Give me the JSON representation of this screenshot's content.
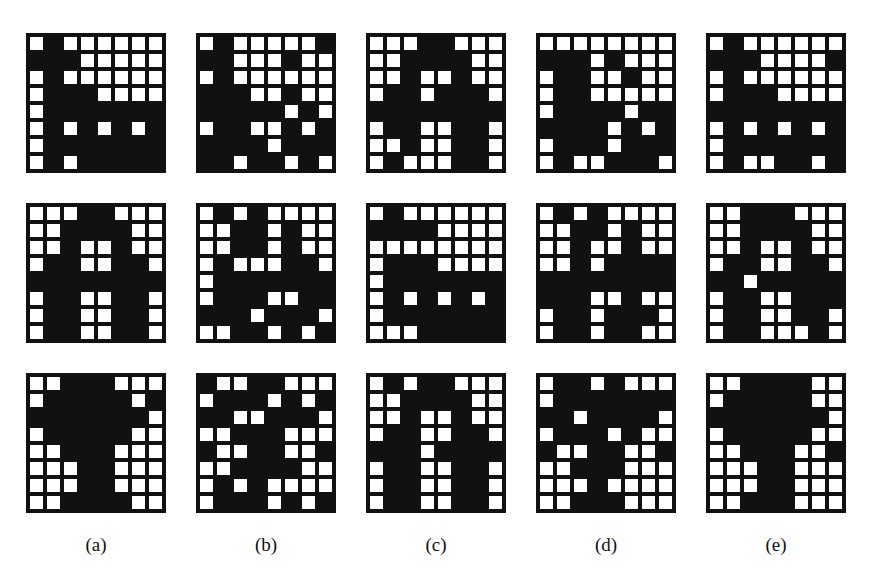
{
  "figure": {
    "columns": [
      {
        "label": "(a)",
        "x": 26
      },
      {
        "label": "(b)",
        "x": 196
      },
      {
        "label": "(c)",
        "x": 366
      },
      {
        "label": "(d)",
        "x": 536
      },
      {
        "label": "(e)",
        "x": 706
      }
    ],
    "rows_y": [
      33,
      203,
      373
    ],
    "grid_size": 8,
    "legend": {
      "white": "1 (white cell)",
      "black": "0 (black cell)"
    },
    "grids": [
      [
        [
          "WBWWWWWW",
          "BBBWWWWW",
          "WBWWWWWW",
          "WBBBWWWW",
          "WBBBBBBB",
          "WBWBWBWB",
          "WBBBBBBB",
          "WBWBBBBB"
        ],
        [
          "WBWWWWWB",
          "BBWWWBWW",
          "WBWWWWWW",
          "BBBWWBWW",
          "BBBBBWBW",
          "WBBWWBWB",
          "BBBBWBBB",
          "BBWBBWBW"
        ],
        [
          "WWWBBWWW",
          "WWBBBBWW",
          "WWBWWBWW",
          "WBBWBBBW",
          "BBBBBBBB",
          "WBBWWBBW",
          "WWBWWBBW",
          "WBWWWBBW"
        ],
        [
          "WWWWWWWW",
          "BBBWBWWW",
          "WBBWWBWW",
          "WBBWWWWW",
          "WBBBBWBB",
          "BBBBWBWB",
          "WBBBWBBB",
          "WBWWBBBW"
        ],
        [
          "WBWWWWWW",
          "BBBWWWWB",
          "WBWWWWWW",
          "WBBBWWWW",
          "BBBBBBBB",
          "WBWBWBWB",
          "WBBBBBBB",
          "WBWWBBWB"
        ]
      ],
      [
        [
          "WWWBBWWW",
          "WWBBBBWW",
          "WWBWWBWW",
          "WBBWWBBW",
          "BBBBBBBB",
          "WBBWWBBW",
          "WBBWWBBW",
          "WBBWWBBW"
        ],
        [
          "WBWBWWWW",
          "WWBBWBWW",
          "WWBBWBWW",
          "WBWWWBBW",
          "WBBBBBBB",
          "WBBBWWBB",
          "BBBWBBBW",
          "WWBBWBWB"
        ],
        [
          "WBWWWWWW",
          "BBBBWWWW",
          "WWWWWWWW",
          "WBBBWWWW",
          "WBBBBBBB",
          "WBWBWBWB",
          "WBBBBBBB",
          "WWWBBBBB"
        ],
        [
          "WBWBWWWW",
          "WWBBWBWW",
          "WWBWWBWW",
          "WWBWBBBB",
          "BBBBBBBB",
          "BBBWWBWW",
          "WBBWBBBW",
          "WBBWBBWW"
        ],
        [
          "WWBBBWWW",
          "WWBBBBWW",
          "WWBWWBWW",
          "WBBWWBBW",
          "BBWBBBBB",
          "WBBWWBBB",
          "WBBWWBBW",
          "WBBWWWBW"
        ]
      ],
      [
        [
          "WWBBBWWW",
          "WBBBBBWB",
          "BBBBBBBW",
          "WBBBBBWW",
          "WWBBBWWW",
          "WWWBBWWW",
          "WWWBBWWW",
          "WWBBBBWW"
        ],
        [
          "BWWBBWWW",
          "WBBBWBWB",
          "BBWWBBBW",
          "WWBBBWWW",
          "BWWBBWWB",
          "WWBBBBWW",
          "WBWBWWWW",
          "WBBBWBWB"
        ],
        [
          "WBWBBWWW",
          "WWBBBBWW",
          "WWBWWBWW",
          "WBBWWBBW",
          "BBBWBBBB",
          "WBBWWBBW",
          "WBBWWBBW",
          "WBBWWBBW"
        ],
        [
          "WBBWBWWW",
          "WBBBBBBB",
          "BBWBBBBW",
          "WBBBWBWW",
          "BWWBBWWB",
          "WWBBBWWW",
          "WWWBWWWW",
          "WWBBBWWW"
        ],
        [
          "WWBBBBWW",
          "WBBBBBWW",
          "BBBBBBBW",
          "WBBBBBWW",
          "WWBBBWWB",
          "WWWBBWWW",
          "WWWBBWWW",
          "WWBBBWWW"
        ]
      ]
    ]
  }
}
